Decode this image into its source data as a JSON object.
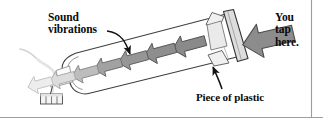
{
  "figure": {
    "kind": "science-diagram",
    "background_color": "#ffffff",
    "border_color": "#9a9a9a"
  },
  "labels": {
    "sound_vibrations": {
      "line1": "Sound",
      "line2": "vibrations"
    },
    "you_tap_here": {
      "line1": "You",
      "line2": "tap",
      "line3": "here."
    },
    "piece_of_plastic": "Piece of plastic"
  },
  "objects": {
    "bottle": {
      "name": "plastic bottle",
      "outline_color": "#3a3a3a",
      "fill_color": "#ffffff"
    },
    "plastic_sheet": {
      "name": "piece of plastic",
      "fill_color": "#d8d8d8",
      "edge_color": "#3a3a3a"
    },
    "candle": {
      "name": "candle with smoke",
      "body_color": "#f2f2f2",
      "outline_color": "#555555",
      "smoke_color": "#d8d8d8"
    },
    "tap_arrow": {
      "name": "tap arrow",
      "fill_color": "#8c8c8c",
      "outline_color": "#4a4a4a",
      "direction": "left"
    }
  },
  "vibration_arrows": {
    "direction": "left",
    "count": 7,
    "fade_note": "arrows fade from dark grey near the plastic to near-white at the bottle neck",
    "items": [
      {
        "index": 1,
        "fill": "#8a8a8a",
        "outline": "#4f4f4f"
      },
      {
        "index": 2,
        "fill": "#8e8e8e",
        "outline": "#545454"
      },
      {
        "index": 3,
        "fill": "#969696",
        "outline": "#5e5e5e"
      },
      {
        "index": 4,
        "fill": "#a2a2a2",
        "outline": "#6c6c6c"
      },
      {
        "index": 5,
        "fill": "#bdbdbd",
        "outline": "#8a8a8a"
      },
      {
        "index": 6,
        "fill": "#dcdcdc",
        "outline": "#aaaaaa"
      },
      {
        "index": 7,
        "fill": "#ededed",
        "outline": "#c2c2c2"
      }
    ]
  },
  "leader_lines": {
    "sound_vibrations": "curved arrow from the Sound vibrations text down to a vibration arrow inside the bottle",
    "piece_of_plastic": "straight arrow from the Piece of plastic text up-left to the plastic sheet"
  }
}
